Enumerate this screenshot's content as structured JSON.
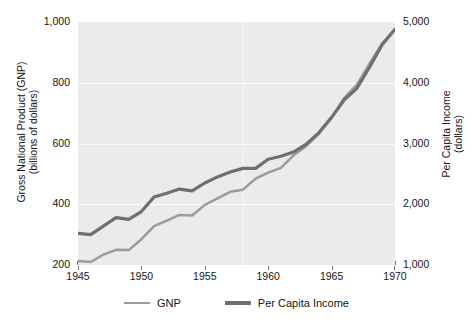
{
  "chart_data": {
    "type": "line",
    "title": "",
    "subtitle": "",
    "xlabel": "",
    "ylabel": "Gross National Product (GNP)",
    "ylabel_line2": "(billions of dollars)",
    "y2label": "Per Capita Income",
    "y2label_line2": "(dollars)",
    "grid": true,
    "legend_position": "bottom",
    "plot_background": "#ebebeb",
    "gridline_color": "#fbfbfb",
    "xlim": [
      1945,
      1970
    ],
    "ylim": [
      200,
      1000
    ],
    "y2lim": [
      1000,
      5000
    ],
    "xticks": [
      1945,
      1950,
      1955,
      1960,
      1965,
      1970
    ],
    "xticklabels": [
      "1945",
      "1950",
      "1955",
      "1960",
      "1965",
      "1970"
    ],
    "yticks": [
      200,
      400,
      600,
      800,
      1000
    ],
    "yticklabels": [
      "200",
      "400",
      "600",
      "800",
      "1,000"
    ],
    "y2ticks": [
      1000,
      2000,
      3000,
      4000,
      5000
    ],
    "y2ticklabels": [
      "1,000",
      "2,000",
      "3,000",
      "4,000",
      "5,000"
    ],
    "x": [
      1945,
      1946,
      1947,
      1948,
      1949,
      1950,
      1951,
      1952,
      1953,
      1954,
      1955,
      1956,
      1957,
      1958,
      1959,
      1960,
      1961,
      1962,
      1963,
      1964,
      1965,
      1966,
      1967,
      1968,
      1969,
      1970
    ],
    "series": [
      {
        "name": "GNP",
        "axis": "left",
        "color": "#9b9b9b",
        "width": 2.5,
        "units": "billions of dollars",
        "values": [
          213,
          210,
          234,
          250,
          249,
          285,
          328,
          346,
          365,
          363,
          398,
          419,
          441,
          448,
          484,
          504,
          520,
          561,
          591,
          632,
          685,
          750,
          794,
          864,
          930,
          977
        ]
      },
      {
        "name": "Per Capita Income",
        "axis": "right",
        "color": "#6f6f6f",
        "width": 3.2,
        "units": "dollars",
        "values": [
          1520,
          1500,
          1640,
          1780,
          1750,
          1880,
          2120,
          2180,
          2250,
          2220,
          2350,
          2450,
          2530,
          2590,
          2590,
          2740,
          2790,
          2860,
          2990,
          3180,
          3430,
          3720,
          3910,
          4260,
          4630,
          4880
        ]
      }
    ],
    "legend": [
      {
        "name": "GNP",
        "color": "#9b9b9b",
        "width": 2.5
      },
      {
        "name": "Per Capita Income",
        "color": "#6f6f6f",
        "width": 3.5
      }
    ]
  }
}
